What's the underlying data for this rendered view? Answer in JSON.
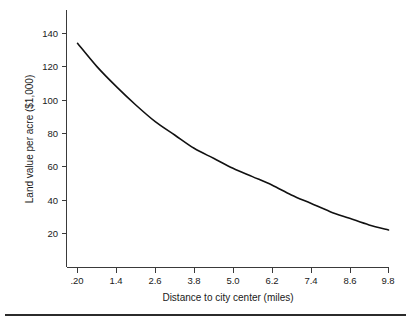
{
  "chart_data": {
    "type": "line",
    "title": "",
    "subtitle": "",
    "xlabel": "Distance to city center (miles)",
    "ylabel": "Land value per acre ($1,000)",
    "xlim": [
      0.2,
      9.8
    ],
    "ylim": [
      10,
      146
    ],
    "grid": false,
    "legend": null,
    "xticks": [
      0.2,
      1.4,
      2.6,
      3.8,
      5.0,
      6.2,
      7.4,
      8.6,
      9.8
    ],
    "xticklabels": [
      ".20",
      "1.4",
      "2.6",
      "3.8",
      "5.0",
      "6.2",
      "7.4",
      "8.6",
      "9.8"
    ],
    "yticks": [
      20,
      40,
      60,
      80,
      100,
      120,
      140
    ],
    "yticklabels": [
      "20",
      "40",
      "60",
      "80",
      "100",
      "120",
      "140"
    ],
    "series": [
      {
        "name": "Land value",
        "x": [
          0.2,
          1.4,
          2.6,
          3.8,
          5.0,
          6.2,
          7.4,
          8.6,
          9.8
        ],
        "values": [
          134,
          108,
          87,
          71,
          60,
          50,
          38,
          28,
          22
        ]
      }
    ],
    "curve_points": [
      {
        "x": 0.2,
        "y": 134
      },
      {
        "x": 0.8,
        "y": 120
      },
      {
        "x": 1.4,
        "y": 108
      },
      {
        "x": 2.0,
        "y": 97
      },
      {
        "x": 2.6,
        "y": 87
      },
      {
        "x": 3.2,
        "y": 79
      },
      {
        "x": 3.8,
        "y": 71
      },
      {
        "x": 4.4,
        "y": 65
      },
      {
        "x": 5.0,
        "y": 59
      },
      {
        "x": 5.6,
        "y": 54
      },
      {
        "x": 6.2,
        "y": 49
      },
      {
        "x": 6.8,
        "y": 43
      },
      {
        "x": 7.4,
        "y": 38
      },
      {
        "x": 8.0,
        "y": 33
      },
      {
        "x": 8.6,
        "y": 29
      },
      {
        "x": 9.2,
        "y": 25
      },
      {
        "x": 9.8,
        "y": 22
      }
    ],
    "colors": {
      "curve": "#111111",
      "axis": "#3a3a3a",
      "background": "#ffffff",
      "text": "#1a1a1a"
    }
  }
}
